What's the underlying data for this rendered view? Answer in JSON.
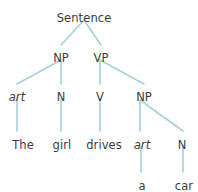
{
  "figure": {
    "type": "constituency-parse-tree",
    "sentence": "The girl drives a car",
    "background_color": "#ffffff",
    "edge_color": "#a6cfdd",
    "text_color": "#3c3c3c"
  },
  "nodes": {
    "root": {
      "label": "Sentence",
      "x": 84,
      "y": 12,
      "style": "plain"
    },
    "np1": {
      "label": "NP",
      "x": 61,
      "y": 52,
      "style": "plain"
    },
    "vp": {
      "label": "VP",
      "x": 101,
      "y": 52,
      "style": "plain"
    },
    "art1": {
      "label": "art",
      "x": 17,
      "y": 91,
      "style": "italic"
    },
    "n1": {
      "label": "N",
      "x": 61,
      "y": 91,
      "style": "plain"
    },
    "v": {
      "label": "V",
      "x": 100,
      "y": 91,
      "style": "plain"
    },
    "np2": {
      "label": "NP",
      "x": 144,
      "y": 91,
      "style": "plain"
    },
    "the": {
      "label": "The",
      "x": 23,
      "y": 139,
      "style": "plain"
    },
    "girl": {
      "label": "girl",
      "x": 62,
      "y": 139,
      "style": "plain"
    },
    "drives": {
      "label": "drives",
      "x": 104,
      "y": 139,
      "style": "plain"
    },
    "art2": {
      "label": "art",
      "x": 142,
      "y": 139,
      "style": "italic"
    },
    "n2": {
      "label": "N",
      "x": 182,
      "y": 139,
      "style": "plain"
    },
    "a": {
      "label": "a",
      "x": 142,
      "y": 180,
      "style": "plain"
    },
    "car": {
      "label": "car",
      "x": 184,
      "y": 180,
      "style": "plain"
    }
  },
  "edges": [
    {
      "name": "edge-sentence-np",
      "from": "root",
      "to": "np1",
      "x1": 84,
      "y1": 20,
      "x2": 61,
      "y2": 45
    },
    {
      "name": "edge-sentence-vp",
      "from": "root",
      "to": "vp",
      "x1": 84,
      "y1": 20,
      "x2": 101,
      "y2": 45
    },
    {
      "name": "edge-np-art",
      "from": "np1",
      "to": "art1",
      "x1": 61,
      "y1": 60,
      "x2": 17,
      "y2": 84
    },
    {
      "name": "edge-np-n",
      "from": "np1",
      "to": "n1",
      "x1": 61,
      "y1": 60,
      "x2": 61,
      "y2": 84
    },
    {
      "name": "edge-vp-v",
      "from": "vp",
      "to": "v",
      "x1": 100,
      "y1": 60,
      "x2": 100,
      "y2": 84
    },
    {
      "name": "edge-vp-np2",
      "from": "vp",
      "to": "np2",
      "x1": 100,
      "y1": 60,
      "x2": 144,
      "y2": 84
    },
    {
      "name": "edge-art-the",
      "from": "art1",
      "to": "the",
      "x1": 17,
      "y1": 99,
      "x2": 17,
      "y2": 131
    },
    {
      "name": "edge-n-girl",
      "from": "n1",
      "to": "girl",
      "x1": 61,
      "y1": 99,
      "x2": 61,
      "y2": 131
    },
    {
      "name": "edge-v-drives",
      "from": "v",
      "to": "drives",
      "x1": 100,
      "y1": 99,
      "x2": 100,
      "y2": 131
    },
    {
      "name": "edge-np2-art2",
      "from": "np2",
      "to": "art2",
      "x1": 140,
      "y1": 100,
      "x2": 140,
      "y2": 131
    },
    {
      "name": "edge-np2-n2",
      "from": "np2",
      "to": "n2",
      "x1": 140,
      "y1": 100,
      "x2": 183,
      "y2": 131
    },
    {
      "name": "edge-art2-a",
      "from": "art2",
      "to": "a",
      "x1": 141,
      "y1": 146,
      "x2": 141,
      "y2": 172
    },
    {
      "name": "edge-n2-car",
      "from": "n2",
      "to": "car",
      "x1": 183,
      "y1": 146,
      "x2": 183,
      "y2": 172
    }
  ]
}
